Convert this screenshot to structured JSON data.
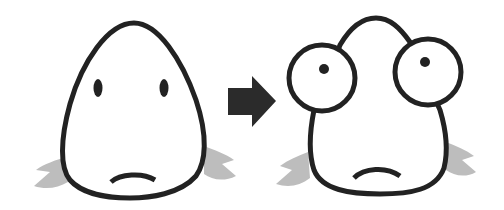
{
  "illustration": {
    "description": "Before/after cartoon: a teardrop-shaped fish face transforms into a bug-eyed fish face",
    "colors": {
      "background": "#ffffff",
      "outline": "#222222",
      "fins": "#bdbdbd",
      "arrow": "#2b2b2b"
    },
    "panels": [
      {
        "name": "before",
        "features": [
          "teardrop-head",
          "oval-eyes",
          "frown-mouth",
          "side-fins"
        ]
      },
      {
        "name": "after",
        "features": [
          "bulging-round-eyes",
          "dot-pupils",
          "frown-mouth",
          "side-fins"
        ]
      }
    ],
    "arrow": {
      "direction": "right"
    }
  }
}
